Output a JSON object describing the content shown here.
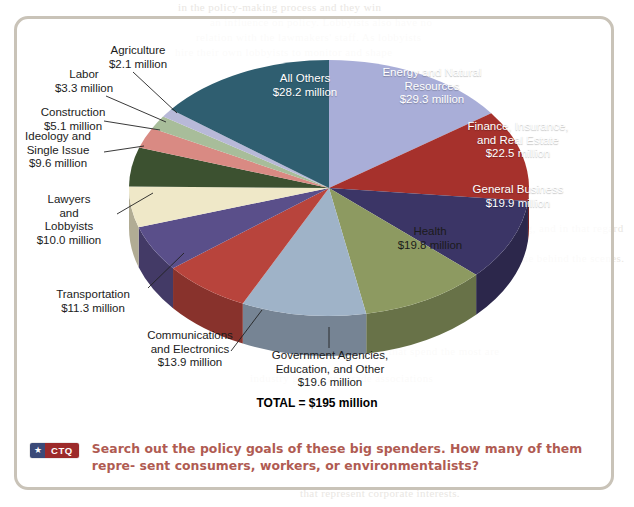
{
  "frame": {
    "border_color": "#c9c3b8"
  },
  "chart_data": {
    "type": "pie",
    "title": "",
    "total_label": "TOTAL = $195 million",
    "total_value": 195,
    "unit": "million dollars",
    "value_suffix": " million",
    "categories": [
      "Energy and Natural Resources",
      "Finance, Insurance, and Real Estate",
      "General Business",
      "Health",
      "Government Agencies, Education, and Other",
      "Communications and Electronics",
      "Transportation",
      "Lawyers and Lobbyists",
      "Ideology and Single Issue",
      "Construction",
      "Labor",
      "Agriculture",
      "All Others"
    ],
    "values": [
      29.3,
      22.5,
      19.9,
      19.8,
      19.6,
      13.9,
      11.3,
      10.0,
      9.6,
      5.1,
      3.3,
      2.1,
      28.2
    ],
    "colors": [
      "#a9aed8",
      "#a6312c",
      "#3b3566",
      "#8d9a61",
      "#9fb3c8",
      "#b8443c",
      "#5a4f8a",
      "#efe8c8",
      "#3c5130",
      "#d98a83",
      "#a8bd9a",
      "#b8b9d8",
      "#2f5e70"
    ],
    "legend": "none",
    "grid": false
  },
  "slices": [
    {
      "name": "energy-and-natural-resources",
      "label": "Energy and Natural\nResources\n$29.3 million",
      "value": 29.3,
      "color": "#a9aed8"
    },
    {
      "name": "finance-insurance-real-estate",
      "label": "Finance, Insurance,\nand Real Estate\n$22.5 million",
      "value": 22.5,
      "color": "#a6312c"
    },
    {
      "name": "general-business",
      "label": "General Business\n$19.9 million",
      "value": 19.9,
      "color": "#3b3566"
    },
    {
      "name": "health",
      "label": "Health\n$19.8 million",
      "value": 19.8,
      "color": "#8d9a61"
    },
    {
      "name": "government-agencies-education-and-other",
      "label": "Government Agencies,\nEducation, and Other\n$19.6 million",
      "value": 19.6,
      "color": "#9fb3c8"
    },
    {
      "name": "communications-and-electronics",
      "label": "Communications\nand Electronics\n$13.9 million",
      "value": 13.9,
      "color": "#b8443c"
    },
    {
      "name": "transportation",
      "label": "Transportation\n$11.3 million",
      "value": 11.3,
      "color": "#5a4f8a"
    },
    {
      "name": "lawyers-and-lobbyists",
      "label": "Lawyers\nand\nLobbyists\n$10.0 million",
      "value": 10.0,
      "color": "#efe8c8"
    },
    {
      "name": "ideology-and-single-issue",
      "label": "Ideology and\nSingle Issue\n$9.6 million",
      "value": 9.6,
      "color": "#3c5130"
    },
    {
      "name": "construction",
      "label": "Construction\n$5.1 million",
      "value": 5.1,
      "color": "#d98a83"
    },
    {
      "name": "labor",
      "label": "Labor\n$3.3 million",
      "value": 3.3,
      "color": "#a8bd9a"
    },
    {
      "name": "agriculture",
      "label": "Agriculture\n$2.1 million",
      "value": 2.1,
      "color": "#b8b9d8"
    },
    {
      "name": "all-others",
      "label": "All Others\n$28.2 million",
      "value": 28.2,
      "color": "#2f5e70"
    }
  ],
  "labels": {
    "agriculture": "Agriculture\n$2.1 million",
    "labor": "Labor\n$3.3 million",
    "construction": "Construction\n$5.1 million",
    "ideology": "Ideology and\nSingle Issue\n$9.6 million",
    "lawyers": "Lawyers\nand\nLobbyists\n$10.0 million",
    "transportation": "Transportation\n$11.3 million",
    "communications": "Communications\nand Electronics\n$13.9 million",
    "government": "Government Agencies,\nEducation, and Other\n$19.6 million",
    "all_others": "All Others\n$28.2 million",
    "energy": "Energy and Natural\nResources\n$29.3 million",
    "finance": "Finance, Insurance,\nand Real Estate\n$22.5 million",
    "general_business": "General Business\n$19.9 million",
    "health": "Health\n$19.8 million",
    "total": "TOTAL = $195 million"
  },
  "ctq": {
    "star": "★",
    "badge": "CTQ",
    "text": "Search out the policy goals of these big spenders. How many of them repre-\nsent consumers, workers, or environmentalists?"
  },
  "bleed_text": [
    "in the policy-making process and they win",
    "an influence on policy. Lobbyists also have no",
    "relation with the lawmakers' staff.  As lobbyists",
    "hire their own lobbyists to monitor and shape",
    "regulations and rulemaking, and in that regard",
    "much of the work is done behind the scenes.",
    "The organizations that spend the most are",
    "industry groups and trade associations",
    "that represent corporate interests."
  ]
}
